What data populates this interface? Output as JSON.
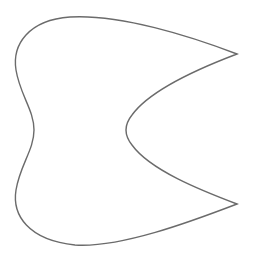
{
  "diagram": {
    "stroke_color": "#6b6b6b",
    "fill_color": "#ffffff",
    "background": "#ffffff",
    "path": "M237 54 C190 36 120 14 70 17 C28 20 12 45 16 70 C20 95 34 110 34 130 C34 150 20 165 16 190 C12 215 28 240 75 245 C120 248 190 222 237 204 C200 190 150 170 132 145 C124 135 124 125 132 115 C150 90 200 68 237 54 Z"
  }
}
